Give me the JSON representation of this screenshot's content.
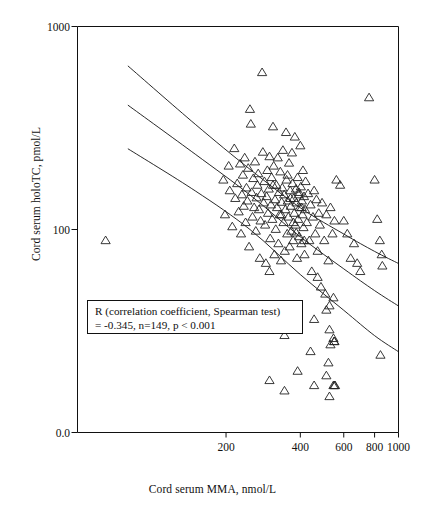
{
  "chart_data": {
    "type": "scatter",
    "title": "",
    "xlabel": "Cord serum MMA, nmol/L",
    "ylabel": "Cord serum holoTC, pmol/L",
    "xscale": "log",
    "yscale": "log",
    "xlim": [
      50,
      1000
    ],
    "ylim": [
      10,
      1000
    ],
    "grid": false,
    "legend": "none",
    "marker": "open-triangle-up",
    "x_ticks": [
      200,
      400,
      600,
      800,
      1000
    ],
    "x_tick_labels": [
      "200",
      "400",
      "600",
      "800",
      "1000"
    ],
    "y_ticks": [
      100,
      1000
    ],
    "y_tick_labels": [
      "100",
      "1000"
    ],
    "y_axis_origin_label": "0.0",
    "annotation": {
      "line1": "R (correlation coefficient, Spearman test)",
      "line2": "= -0.345, n=149, p < 0.001",
      "r": -0.345,
      "n": 149,
      "p": "< 0.001",
      "test": "Spearman"
    },
    "points": [
      [
        65,
        88
      ],
      [
        195,
        175
      ],
      [
        198,
        118
      ],
      [
        205,
        205
      ],
      [
        207,
        155
      ],
      [
        212,
        103
      ],
      [
        216,
        250
      ],
      [
        218,
        142
      ],
      [
        222,
        168
      ],
      [
        225,
        122
      ],
      [
        228,
        210
      ],
      [
        230,
        95
      ],
      [
        232,
        148
      ],
      [
        234,
        185
      ],
      [
        236,
        130
      ],
      [
        238,
        225
      ],
      [
        240,
        108
      ],
      [
        242,
        160
      ],
      [
        244,
        138
      ],
      [
        246,
        200
      ],
      [
        248,
        82
      ],
      [
        250,
        390
      ],
      [
        252,
        330
      ],
      [
        254,
        152
      ],
      [
        256,
        115
      ],
      [
        258,
        178
      ],
      [
        260,
        128
      ],
      [
        262,
        215
      ],
      [
        264,
        98
      ],
      [
        266,
        143
      ],
      [
        268,
        165
      ],
      [
        270,
        188
      ],
      [
        272,
        125
      ],
      [
        274,
        72
      ],
      [
        276,
        110
      ],
      [
        278,
        150
      ],
      [
        280,
        592
      ],
      [
        282,
        240
      ],
      [
        284,
        135
      ],
      [
        286,
        172
      ],
      [
        288,
        105
      ],
      [
        290,
        68
      ],
      [
        292,
        145
      ],
      [
        294,
        195
      ],
      [
        296,
        120
      ],
      [
        298,
        158
      ],
      [
        300,
        62
      ],
      [
        302,
        90
      ],
      [
        304,
        132
      ],
      [
        306,
        180
      ],
      [
        308,
        112
      ],
      [
        310,
        320
      ],
      [
        312,
        205
      ],
      [
        314,
        75
      ],
      [
        316,
        140
      ],
      [
        318,
        100
      ],
      [
        320,
        165
      ],
      [
        322,
        128
      ],
      [
        324,
        225
      ],
      [
        326,
        85
      ],
      [
        328,
        152
      ],
      [
        330,
        118
      ],
      [
        332,
        192
      ],
      [
        334,
        70
      ],
      [
        336,
        136
      ],
      [
        338,
        160
      ],
      [
        340,
        245
      ],
      [
        342,
        108
      ],
      [
        344,
        148
      ],
      [
        346,
        78
      ],
      [
        348,
        125
      ],
      [
        350,
        300
      ],
      [
        352,
        175
      ],
      [
        354,
        95
      ],
      [
        356,
        138
      ],
      [
        358,
        115
      ],
      [
        360,
        212
      ],
      [
        362,
        82
      ],
      [
        364,
        155
      ],
      [
        366,
        130
      ],
      [
        368,
        98
      ],
      [
        370,
        238
      ],
      [
        372,
        168
      ],
      [
        374,
        88
      ],
      [
        376,
        142
      ],
      [
        378,
        120
      ],
      [
        380,
        285
      ],
      [
        382,
        105
      ],
      [
        384,
        158
      ],
      [
        386,
        135
      ],
      [
        388,
        72
      ],
      [
        390,
        180
      ],
      [
        392,
        112
      ],
      [
        394,
        148
      ],
      [
        396,
        92
      ],
      [
        398,
        128
      ],
      [
        400,
        258
      ],
      [
        402,
        162
      ],
      [
        404,
        85
      ],
      [
        406,
        138
      ],
      [
        408,
        118
      ],
      [
        410,
        195
      ],
      [
        412,
        102
      ],
      [
        414,
        145
      ],
      [
        416,
        75
      ],
      [
        418,
        125
      ],
      [
        420,
        172
      ],
      [
        425,
        108
      ],
      [
        430,
        150
      ],
      [
        435,
        88
      ],
      [
        440,
        132
      ],
      [
        445,
        62
      ],
      [
        450,
        115
      ],
      [
        455,
        155
      ],
      [
        460,
        95
      ],
      [
        465,
        140
      ],
      [
        470,
        78
      ],
      [
        475,
        120
      ],
      [
        480,
        105
      ],
      [
        490,
        135
      ],
      [
        500,
        88
      ],
      [
        510,
        118
      ],
      [
        520,
        70
      ],
      [
        530,
        128
      ],
      [
        540,
        95
      ],
      [
        550,
        110
      ],
      [
        300,
        228
      ],
      [
        310,
        165
      ],
      [
        335,
        118
      ],
      [
        355,
        185
      ],
      [
        365,
        142
      ],
      [
        375,
        108
      ],
      [
        385,
        96
      ],
      [
        395,
        152
      ],
      [
        405,
        128
      ],
      [
        415,
        88
      ],
      [
        470,
        58
      ],
      [
        485,
        52
      ],
      [
        505,
        48
      ],
      [
        525,
        42
      ],
      [
        545,
        46
      ],
      [
        560,
        175
      ],
      [
        580,
        165
      ],
      [
        600,
        110
      ],
      [
        620,
        95
      ],
      [
        640,
        72
      ],
      [
        660,
        85
      ],
      [
        680,
        68
      ],
      [
        700,
        62
      ],
      [
        760,
        445
      ],
      [
        800,
        175
      ],
      [
        820,
        112
      ],
      [
        840,
        88
      ],
      [
        855,
        75
      ],
      [
        860,
        66
      ],
      [
        300,
        38
      ],
      [
        345,
        30
      ],
      [
        390,
        33
      ],
      [
        455,
        36
      ],
      [
        510,
        40
      ],
      [
        525,
        32
      ],
      [
        530,
        27
      ],
      [
        545,
        29
      ],
      [
        548,
        28
      ],
      [
        550,
        28
      ],
      [
        300,
        18
      ],
      [
        345,
        16
      ],
      [
        390,
        20
      ],
      [
        455,
        17
      ],
      [
        510,
        19
      ],
      [
        520,
        22
      ],
      [
        525,
        15
      ],
      [
        545,
        17
      ],
      [
        550,
        17
      ],
      [
        553,
        17
      ],
      [
        440,
        25
      ],
      [
        845,
        24
      ]
    ],
    "fit_lines": [
      {
        "name": "upper-band",
        "points": [
          [
            80,
            640
          ],
          [
            150,
            330
          ],
          [
            250,
            198
          ],
          [
            400,
            128
          ],
          [
            600,
            95
          ],
          [
            800,
            78
          ],
          [
            1000,
            68
          ]
        ]
      },
      {
        "name": "regression-line",
        "points": [
          [
            80,
            410
          ],
          [
            150,
            235
          ],
          [
            250,
            148
          ],
          [
            400,
            92
          ],
          [
            600,
            64
          ],
          [
            800,
            50
          ],
          [
            1000,
            42
          ]
        ]
      },
      {
        "name": "lower-band",
        "points": [
          [
            80,
            250
          ],
          [
            150,
            155
          ],
          [
            250,
            100
          ],
          [
            400,
            60
          ],
          [
            600,
            40
          ],
          [
            800,
            30
          ],
          [
            1000,
            25
          ]
        ]
      }
    ]
  },
  "axes": {
    "x_title": "Cord serum MMA, nmol/L",
    "y_title": "Cord serum holoTC, pmol/L",
    "x_tick_labels": [
      "200",
      "400",
      "600",
      "800",
      "1000"
    ],
    "y_tick_labels": [
      "1000",
      "100",
      "0.0"
    ]
  },
  "colors": {
    "axis": "#111111",
    "marker_stroke": "#222222",
    "line": "#111111",
    "background": "#ffffff"
  }
}
